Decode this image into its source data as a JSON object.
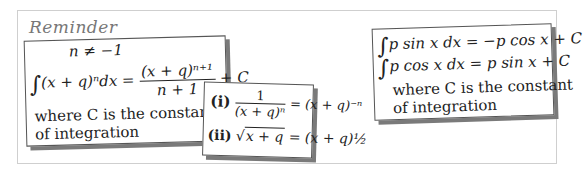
{
  "title": "Reminder",
  "card1": {
    "condition": "n ≠ −1",
    "integral_lhs": "(x + q)ⁿdx =",
    "fraction_numerator": "(x + q)ⁿ⁺¹",
    "fraction_denominator": "n + 1",
    "constant": "+ C",
    "note_line1": "where C is the constant",
    "note_line2": "of integration"
  },
  "card2": {
    "item1_label": "(i)",
    "item1_num": "1",
    "item1_den": "(x + q)ⁿ",
    "item1_rhs": "= (x + q)⁻ⁿ",
    "item2_label": "(ii)",
    "item2_lhs": "x + q",
    "item2_rhs": "= (x + q)½"
  },
  "card3": {
    "line1": "p sin x dx = −p cos x + C",
    "line2": "p cos x dx = p sin x + C",
    "note_line1": "where C is the constant",
    "note_line2": "of integration"
  },
  "colors": {
    "frame_border": "#cfcfcf",
    "card_border": "#555555",
    "shadow": "#7a7a7a",
    "title": "#777777"
  }
}
